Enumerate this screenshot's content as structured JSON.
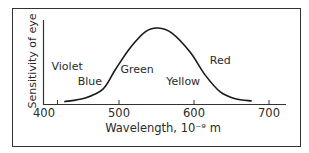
{
  "chart_data": {
    "type": "line",
    "title": "",
    "xlabel": "Wavelength, 10⁻⁹ m",
    "ylabel": "Sensitivity of eye",
    "xlim": [
      400,
      725
    ],
    "ylim": [
      0,
      1.1
    ],
    "xticks": [
      400,
      500,
      600,
      700
    ],
    "xtick_labels": [
      "400",
      "500",
      "600",
      "700"
    ],
    "extra_tick": 418,
    "grid": false,
    "legend": "none",
    "series": [
      {
        "name": "Sensitivity of eye",
        "x": [
          427,
          455,
          479,
          495,
          515,
          535,
          552,
          571,
          595,
          615,
          635,
          655,
          677
        ],
        "y": [
          0.03,
          0.08,
          0.2,
          0.45,
          0.74,
          0.95,
          1.0,
          0.93,
          0.68,
          0.38,
          0.16,
          0.07,
          0.04
        ]
      }
    ],
    "annotations": [
      {
        "text": "Violet",
        "x": 410,
        "y": 0.45
      },
      {
        "text": "Blue",
        "x": 445,
        "y": 0.25
      },
      {
        "text": "Green",
        "x": 502,
        "y": 0.41
      },
      {
        "text": "Yellow",
        "x": 563,
        "y": 0.25
      },
      {
        "text": "Red",
        "x": 621,
        "y": 0.52
      }
    ],
    "colors": {
      "line": "#1a1a1a",
      "frame": "#333333",
      "text": "#2a2a2a"
    }
  }
}
